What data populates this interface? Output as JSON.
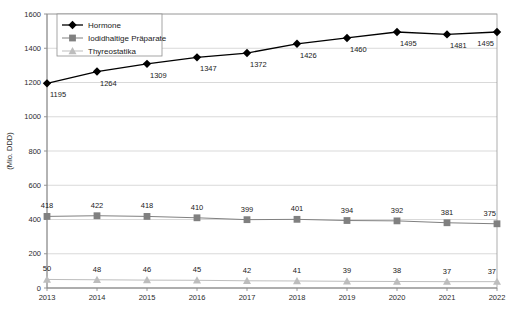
{
  "chart_data": {
    "type": "line",
    "title": "",
    "xlabel": "",
    "ylabel": "(Mio. DDD)",
    "categories": [
      "2013",
      "2014",
      "2015",
      "2016",
      "2017",
      "2018",
      "2019",
      "2020",
      "2021",
      "2022"
    ],
    "ylim": [
      0,
      1600
    ],
    "yticks": [
      0,
      200,
      400,
      600,
      800,
      1000,
      1200,
      1400,
      1600
    ],
    "ytick_labels": [
      "0",
      "200",
      "400",
      "600",
      "800",
      "1000",
      "1200",
      "1400",
      "1600"
    ],
    "grid": true,
    "legend_position": "top-left-inside",
    "series": [
      {
        "name": "Hormone",
        "marker": "diamond",
        "color": "#000000",
        "values": [
          1195,
          1264,
          1309,
          1347,
          1372,
          1426,
          1460,
          1495,
          1481,
          1495
        ],
        "labels": [
          "1195",
          "1264",
          "1309",
          "1347",
          "1372",
          "1426",
          "1460",
          "1495",
          "1481",
          "1495"
        ]
      },
      {
        "name": "Iodidhaltige Präparate",
        "marker": "square",
        "color": "#808080",
        "values": [
          418,
          422,
          418,
          410,
          399,
          401,
          394,
          392,
          381,
          375
        ],
        "labels": [
          "418",
          "422",
          "418",
          "410",
          "399",
          "401",
          "394",
          "392",
          "381",
          "375"
        ]
      },
      {
        "name": "Thyreostatika",
        "marker": "triangle",
        "color": "#bdbdbd",
        "values": [
          50,
          48,
          46,
          45,
          42,
          41,
          39,
          38,
          37,
          37
        ],
        "labels": [
          "50",
          "48",
          "46",
          "45",
          "42",
          "41",
          "39",
          "38",
          "37",
          "37"
        ]
      }
    ]
  },
  "axis": {
    "y_title": "(Mio. DDD)"
  },
  "legend": {
    "items": [
      {
        "label": "Hormone"
      },
      {
        "label": "Iodidhaltige Präparate"
      },
      {
        "label": "Thyreostatika"
      }
    ]
  }
}
